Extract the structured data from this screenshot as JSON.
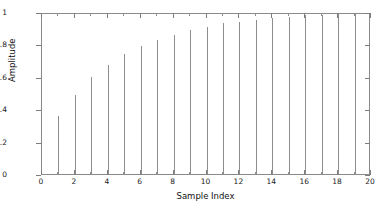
{
  "chart_data": {
    "type": "bar",
    "title": "",
    "subtitle": "",
    "xlabel": "Sample Index",
    "ylabel": "Amplitude",
    "xlim": [
      0,
      20
    ],
    "ylim": [
      0,
      1
    ],
    "grid": false,
    "legend": null,
    "x_major_ticks": [
      0,
      2,
      4,
      6,
      8,
      10,
      12,
      14,
      16,
      18,
      20
    ],
    "x_major_tick_labels": [
      "0",
      "2",
      "4",
      "6",
      "8",
      "10",
      "12",
      "14",
      "16",
      "18",
      "20"
    ],
    "x_minor_ticks": [
      1,
      3,
      5,
      7,
      9,
      11,
      13,
      15,
      17,
      19
    ],
    "y_ticks": [
      0,
      0.2,
      0.4,
      0.6,
      0.8,
      1
    ],
    "y_tick_labels": [
      "0",
      "0.2",
      "0.4",
      "0.6",
      "0.8",
      "1"
    ],
    "categories": [
      1,
      2,
      3,
      4,
      5,
      6,
      7,
      8,
      9,
      10,
      11,
      12,
      13,
      14,
      15,
      16,
      17,
      18,
      19
    ],
    "values": [
      0.36,
      0.49,
      0.6,
      0.67,
      0.74,
      0.79,
      0.83,
      0.86,
      0.89,
      0.91,
      0.93,
      0.94,
      0.95,
      0.96,
      0.97,
      0.98,
      0.98,
      0.99,
      0.99
    ],
    "series": [
      {
        "name": "amplitude",
        "values": [
          0.36,
          0.49,
          0.6,
          0.67,
          0.74,
          0.79,
          0.83,
          0.86,
          0.89,
          0.91,
          0.93,
          0.94,
          0.95,
          0.96,
          0.97,
          0.98,
          0.98,
          0.99,
          0.99
        ]
      }
    ],
    "colors": {
      "stem": "#8d8d8d",
      "axis": "#8a8a8a",
      "text": "#111111",
      "background": "#ffffff"
    }
  }
}
